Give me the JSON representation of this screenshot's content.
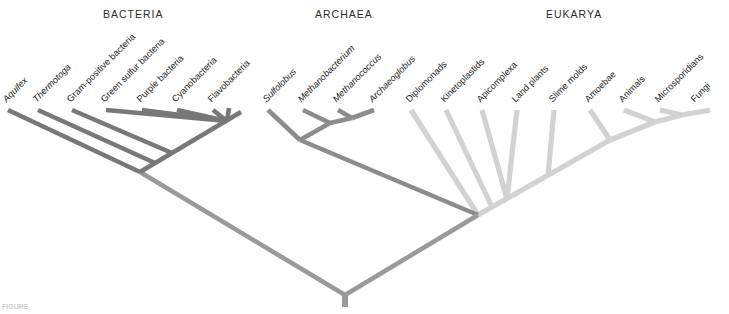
{
  "figure": {
    "type": "phylogenetic-tree",
    "caption": "FIGURE",
    "background": "#ffffff",
    "root": {
      "x": 345,
      "y": 295,
      "stem_bottom_y": 307
    }
  },
  "colors": {
    "bacteria": "#787878",
    "archaea": "#8c8c8c",
    "eukarya": "#d2d2d2",
    "root": "#9a9a9a",
    "text": "#1e1e1e",
    "header_text": "#2b2b2b"
  },
  "domains": [
    {
      "key": "bacteria",
      "label": "BACTERIA",
      "x": 103,
      "y": 8,
      "color": "#787878"
    },
    {
      "key": "archaea",
      "label": "ARCHAEA",
      "x": 315,
      "y": 8,
      "color": "#8c8c8c"
    },
    {
      "key": "eukarya",
      "label": "EUKARYA",
      "x": 546,
      "y": 8,
      "color": "#d2d2d2"
    }
  ],
  "taxa": {
    "bacteria": [
      {
        "name": "Aquifex",
        "italic": true,
        "label_x": 8,
        "label_y": 104,
        "tip_x": 8,
        "tip_y": 110
      },
      {
        "name": "Thermotoga",
        "italic": true,
        "label_x": 38,
        "label_y": 104,
        "tip_x": 38,
        "tip_y": 110
      },
      {
        "name": "Gram-positive bacteria",
        "italic": false,
        "label_x": 72,
        "label_y": 104,
        "tip_x": 72,
        "tip_y": 110
      },
      {
        "name": "Green sulfur bacteria",
        "italic": false,
        "label_x": 106,
        "label_y": 104,
        "tip_x": 106,
        "tip_y": 110
      },
      {
        "name": "Purple bacteria",
        "italic": false,
        "label_x": 142,
        "label_y": 104,
        "tip_x": 142,
        "tip_y": 110
      },
      {
        "name": "Cyanobacteria",
        "italic": false,
        "label_x": 177,
        "label_y": 104,
        "tip_x": 177,
        "tip_y": 110
      },
      {
        "name": "Flavobacteria",
        "italic": false,
        "label_x": 213,
        "label_y": 104,
        "tip_x": 213,
        "tip_y": 110
      }
    ],
    "archaea": [
      {
        "name": "Sulfolobus",
        "italic": true,
        "label_x": 268,
        "label_y": 104,
        "tip_x": 268,
        "tip_y": 110
      },
      {
        "name": "Methanobacterium",
        "italic": true,
        "label_x": 303,
        "label_y": 104,
        "tip_x": 303,
        "tip_y": 110
      },
      {
        "name": "Methanococcus",
        "italic": true,
        "label_x": 338,
        "label_y": 104,
        "tip_x": 338,
        "tip_y": 110
      },
      {
        "name": "Archaeoglobus",
        "italic": true,
        "label_x": 374,
        "label_y": 104,
        "tip_x": 374,
        "tip_y": 110
      }
    ],
    "eukarya": [
      {
        "name": "Diplomonads",
        "italic": false,
        "label_x": 411,
        "label_y": 104,
        "tip_x": 411,
        "tip_y": 110
      },
      {
        "name": "Kinetoplastids",
        "italic": false,
        "label_x": 446,
        "label_y": 104,
        "tip_x": 446,
        "tip_y": 110
      },
      {
        "name": "Apicomplexa",
        "italic": false,
        "label_x": 482,
        "label_y": 104,
        "tip_x": 482,
        "tip_y": 110
      },
      {
        "name": "Land plants",
        "italic": false,
        "label_x": 517,
        "label_y": 104,
        "tip_x": 517,
        "tip_y": 110
      },
      {
        "name": "Slime molds",
        "italic": false,
        "label_x": 554,
        "label_y": 104,
        "tip_x": 554,
        "tip_y": 110
      },
      {
        "name": "Amoebae",
        "italic": false,
        "label_x": 590,
        "label_y": 104,
        "tip_x": 590,
        "tip_y": 110
      },
      {
        "name": "Animals",
        "italic": false,
        "label_x": 624,
        "label_y": 104,
        "tip_x": 624,
        "tip_y": 110
      },
      {
        "name": "Microsporidians",
        "italic": false,
        "label_x": 660,
        "label_y": 104,
        "tip_x": 660,
        "tip_y": 110
      },
      {
        "name": "Fungi",
        "italic": false,
        "label_x": 696,
        "label_y": 104,
        "tip_x": 696,
        "tip_y": 110
      }
    ]
  },
  "branches": {
    "root": [
      {
        "id": "root-stem",
        "d": "M345,295 L345,307"
      },
      {
        "id": "root-to-bact",
        "d": "M345,295 L140,172"
      },
      {
        "id": "root-to-ae",
        "d": "M345,295 L478,215"
      }
    ],
    "bacteria": [
      {
        "id": "bact-spine",
        "d": "M140,172 L241,112"
      },
      {
        "id": "bact-n1",
        "d": "M140,172 L8,110"
      },
      {
        "id": "bact-n2",
        "d": "M155,163 L38,110"
      },
      {
        "id": "bact-n3",
        "d": "M172,153 L72,110"
      },
      {
        "id": "bact-fan-hub",
        "d": "M227,121 L106,110"
      },
      {
        "id": "bact-t5",
        "d": "M227,121 L142,110"
      },
      {
        "id": "bact-t6",
        "d": "M227,121 L177,110"
      },
      {
        "id": "bact-t7",
        "d": "M227,121 L213,110"
      },
      {
        "id": "bact-hub-stem",
        "d": "M227,121 L229,108"
      }
    ],
    "archaea": [
      {
        "id": "arch-root",
        "d": "M478,215 L300,140"
      },
      {
        "id": "arch-n1",
        "d": "M300,140 L268,110"
      },
      {
        "id": "arch-n2",
        "d": "M300,140 L330,123"
      },
      {
        "id": "arch-n3",
        "d": "M330,123 L303,110"
      },
      {
        "id": "arch-n4",
        "d": "M330,123 L352,118"
      },
      {
        "id": "arch-n5",
        "d": "M352,118 L338,110"
      },
      {
        "id": "arch-n6",
        "d": "M352,118 L374,110"
      }
    ],
    "eukarya": [
      {
        "id": "euk-root",
        "d": "M478,215 L610,140"
      },
      {
        "id": "euk-a1",
        "d": "M478,215 L411,110"
      },
      {
        "id": "euk-a2",
        "d": "M492,207 L446,110"
      },
      {
        "id": "euk-a3",
        "d": "M507,199 L482,110"
      },
      {
        "id": "euk-a4",
        "d": "M507,199 L517,110"
      },
      {
        "id": "euk-b1",
        "d": "M548,176 L554,110"
      },
      {
        "id": "euk-c1",
        "d": "M610,140 L590,110"
      },
      {
        "id": "euk-c2",
        "d": "M610,140 L655,122"
      },
      {
        "id": "euk-c3",
        "d": "M655,122 L624,110"
      },
      {
        "id": "euk-c4",
        "d": "M655,122 L682,115"
      },
      {
        "id": "euk-c5",
        "d": "M682,115 L660,110"
      },
      {
        "id": "euk-c6",
        "d": "M682,115 L710,110"
      }
    ]
  }
}
